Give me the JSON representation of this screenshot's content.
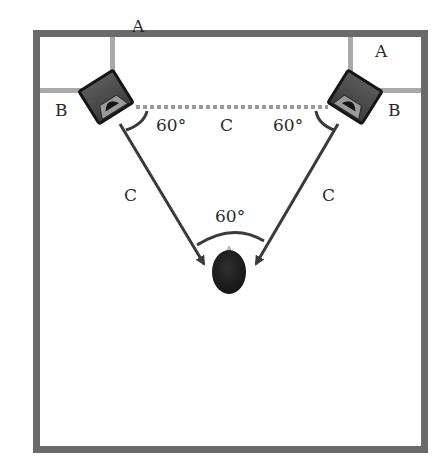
{
  "diagram": {
    "type": "stereo-speaker-placement",
    "colors": {
      "room_border": "#6a6a6a",
      "wall_marker": "#a9a9a9",
      "dotted_line": "#9a9a9a",
      "arrow": "#3a3a3a",
      "speaker_body": "#4a4a4a",
      "speaker_outline": "#151515",
      "listener": "#1c1c1c",
      "label": "#2a2a2a"
    },
    "labels": {
      "left_distance_from_back_wall": "A",
      "left_distance_from_side_wall": "B",
      "right_distance_from_back_wall": "A",
      "right_distance_from_side_wall": "B",
      "left_speaker_angle": "60°",
      "speaker_spacing": "C",
      "right_speaker_angle": "60°",
      "left_listening_distance": "C",
      "right_listening_distance": "C",
      "listener_angle": "60°"
    },
    "nodes": [
      {
        "id": "left-speaker",
        "kind": "speaker"
      },
      {
        "id": "right-speaker",
        "kind": "speaker"
      },
      {
        "id": "listener",
        "kind": "head"
      }
    ],
    "edges": [
      {
        "from": "left-speaker",
        "to": "right-speaker",
        "style": "dotted",
        "label": "C"
      },
      {
        "from": "left-speaker",
        "to": "listener",
        "style": "arrow",
        "label": "C"
      },
      {
        "from": "right-speaker",
        "to": "listener",
        "style": "arrow",
        "label": "C"
      }
    ]
  }
}
